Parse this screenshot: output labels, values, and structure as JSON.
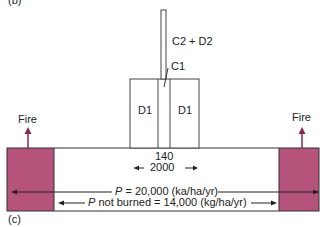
{
  "panel_labels": {
    "top": "(b)",
    "bottom": "(c)"
  },
  "labels": {
    "stem": "C2 + D2",
    "c1": "C1",
    "d1_left": "D1",
    "d1_right": "D1",
    "fire_left": "Fire",
    "fire_right": "Fire",
    "width_top": "140",
    "width_bottom": "2000",
    "p_total_prefix": "P",
    "p_total_value": " = 20,000 (ka/ha/yr)",
    "p_notburned_prefix": "P",
    "p_notburned_value": " not burned = 14,000 (kg/ha/yr)"
  },
  "colors": {
    "burned_fill": "#b5537a",
    "line": "#333333",
    "fire_arrow": "#8a2a4a"
  }
}
